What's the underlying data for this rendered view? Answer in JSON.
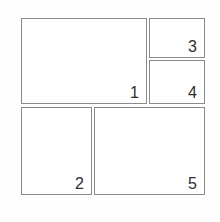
{
  "diagram": {
    "kind": "page-layout-template",
    "background_color": "#fefefe",
    "border_color": "#8a8a8a",
    "label_color": "#2e2e2e",
    "panels": [
      {
        "id": "panel-1",
        "label": "1",
        "x": 21,
        "y": 18,
        "width": 126,
        "height": 86
      },
      {
        "id": "panel-2",
        "label": "2",
        "x": 21,
        "y": 107,
        "width": 71,
        "height": 88
      },
      {
        "id": "panel-3",
        "label": "3",
        "x": 149,
        "y": 18,
        "width": 56,
        "height": 40
      },
      {
        "id": "panel-4",
        "label": "4",
        "x": 149,
        "y": 60,
        "width": 56,
        "height": 44
      },
      {
        "id": "panel-5",
        "label": "5",
        "x": 94,
        "y": 107,
        "width": 111,
        "height": 88
      }
    ]
  }
}
